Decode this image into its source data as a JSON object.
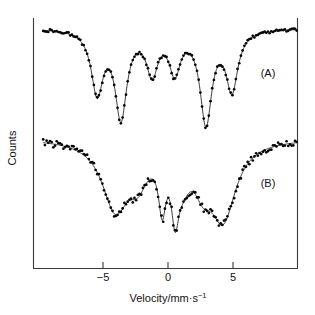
{
  "chart_data": {
    "type": "line",
    "title": "",
    "xlabel": "Velocity/mm·s⁻¹",
    "ylabel": "Counts",
    "xlim": [
      -9.6,
      9.9
    ],
    "ylim": [
      0,
      1
    ],
    "grid": false,
    "legend_position": "inside-right",
    "xticks": [
      -5,
      0,
      5
    ],
    "xticklabels": [
      "−5",
      "0",
      "5"
    ],
    "yticks": [],
    "yticklabels": [],
    "annotations": [
      {
        "text": "(A)",
        "x": 7.4,
        "y_px": 73
      },
      {
        "text": "(B)",
        "x": 7.4,
        "y_px": 183
      }
    ],
    "series": [
      {
        "name": "(A)",
        "label": "(A)",
        "description": "Six-line magnetic hyperfine sextet, sharp narrow absorption lines",
        "baseline_px": 28,
        "lines": [
          {
            "center": -5.45,
            "depth_px": 62,
            "width": 0.55
          },
          {
            "center": -3.62,
            "depth_px": 86,
            "width": 0.55
          },
          {
            "center": -1.22,
            "depth_px": 42,
            "width": 0.52
          },
          {
            "center": 0.52,
            "depth_px": 40,
            "width": 0.52
          },
          {
            "center": 2.92,
            "depth_px": 92,
            "width": 0.55
          },
          {
            "center": 4.92,
            "depth_px": 59,
            "width": 0.55
          }
        ]
      },
      {
        "name": "(B)",
        "label": "(B)",
        "description": "Broadened / relaxed sextet with sharp central doublet superimposed",
        "baseline_px": 138,
        "lines": [
          {
            "center": -4.05,
            "depth_px": 67,
            "width": 1.25
          },
          {
            "center": -2.3,
            "depth_px": 30,
            "width": 0.9
          },
          {
            "center": -0.45,
            "depth_px": 52,
            "width": 0.34
          },
          {
            "center": 0.55,
            "depth_px": 52,
            "width": 0.34
          },
          {
            "center": 1.1,
            "depth_px": 28,
            "width": 0.75
          },
          {
            "center": 2.7,
            "depth_px": 32,
            "width": 0.85
          },
          {
            "center": 4.25,
            "depth_px": 75,
            "width": 1.2
          }
        ]
      }
    ]
  },
  "axes": {
    "x_axis_title": "Velocity/mm·s⁻¹",
    "x_axis_title_main": "Velocity/mm·s",
    "x_axis_title_exponent": "−1",
    "y_axis_title": "Counts",
    "tick_labels": [
      "−5",
      "0",
      "5"
    ]
  },
  "labels": {
    "series_a": "(A)",
    "series_b": "(B)"
  },
  "colors": {
    "curve": "#1a1a1a",
    "points": "#050505",
    "axis": "#3a3a3a",
    "background": "#ffffff"
  }
}
